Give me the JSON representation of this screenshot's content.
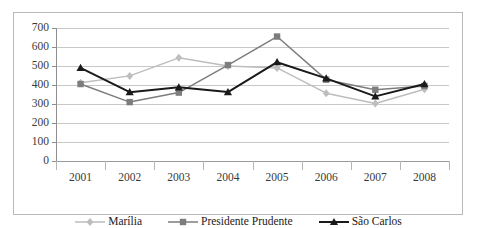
{
  "chart_data": {
    "type": "line",
    "title": "",
    "xlabel": "",
    "ylabel": "",
    "categories": [
      "2001",
      "2002",
      "2003",
      "2004",
      "2005",
      "2006",
      "2007",
      "2008"
    ],
    "ylim": [
      0,
      700
    ],
    "yticks": [
      0,
      100,
      200,
      300,
      400,
      500,
      600,
      700
    ],
    "ytick_labels": [
      "0",
      "100",
      "200",
      "300",
      "400",
      "500",
      "600",
      "700"
    ],
    "grid": true,
    "legend_position": "bottom",
    "series": [
      {
        "name": "Marília",
        "color": "#bdbdbd",
        "marker": "diamond",
        "values": [
          412,
          448,
          543,
          500,
          490,
          357,
          303,
          378
        ]
      },
      {
        "name": "Presidente Prudente",
        "color": "#7d7d7d",
        "marker": "square",
        "values": [
          405,
          310,
          360,
          505,
          655,
          428,
          375,
          395
        ]
      },
      {
        "name": "São Carlos",
        "color": "#1a1a1a",
        "marker": "triangle",
        "values": [
          490,
          362,
          388,
          363,
          520,
          435,
          340,
          405
        ]
      }
    ]
  },
  "axis": {
    "y_label_color": "#3a3a3a",
    "x_label_color": "#3a3a3a",
    "gridline_color": "#c8c8c8"
  },
  "frame": {
    "border_color": "#b9b9b9"
  }
}
